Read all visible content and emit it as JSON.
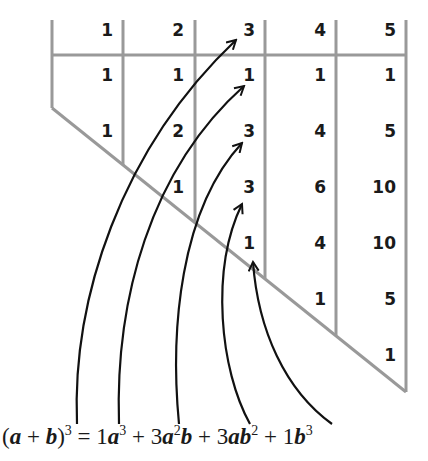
{
  "diagram": {
    "colors": {
      "grid_line": "#999999",
      "text": "#1a1a1a",
      "arrow": "#111111",
      "background": "#ffffff"
    },
    "header": [
      "1",
      "2",
      "3",
      "4",
      "5"
    ],
    "columns": [
      {
        "n": "1",
        "values": [
          "1",
          "1",
          "1"
        ]
      },
      {
        "n": "2",
        "values": [
          "1",
          "2",
          "1"
        ]
      },
      {
        "n": "3",
        "values": [
          "1",
          "3",
          "3",
          "1"
        ]
      },
      {
        "n": "4",
        "values": [
          "1",
          "4",
          "6",
          "4",
          "1"
        ]
      },
      {
        "n": "5",
        "values": [
          "1",
          "5",
          "10",
          "10",
          "5",
          "1"
        ]
      }
    ],
    "cells": [
      {
        "col": 0,
        "row": 0,
        "text": "1"
      },
      {
        "col": 0,
        "row": 1,
        "text": "1"
      },
      {
        "col": 1,
        "row": 0,
        "text": "1"
      },
      {
        "col": 1,
        "row": 1,
        "text": "2"
      },
      {
        "col": 1,
        "row": 2,
        "text": "1"
      },
      {
        "col": 2,
        "row": 0,
        "text": "1"
      },
      {
        "col": 2,
        "row": 1,
        "text": "3"
      },
      {
        "col": 2,
        "row": 2,
        "text": "3"
      },
      {
        "col": 2,
        "row": 3,
        "text": "1"
      },
      {
        "col": 3,
        "row": 0,
        "text": "1"
      },
      {
        "col": 3,
        "row": 1,
        "text": "4"
      },
      {
        "col": 3,
        "row": 2,
        "text": "6"
      },
      {
        "col": 3,
        "row": 3,
        "text": "4"
      },
      {
        "col": 3,
        "row": 4,
        "text": "1"
      },
      {
        "col": 4,
        "row": 0,
        "text": "1"
      },
      {
        "col": 4,
        "row": 1,
        "text": "5"
      },
      {
        "col": 4,
        "row": 2,
        "text": "10"
      },
      {
        "col": 4,
        "row": 3,
        "text": "10"
      },
      {
        "col": 4,
        "row": 4,
        "text": "5"
      },
      {
        "col": 4,
        "row": 5,
        "text": "1"
      }
    ],
    "formula": {
      "lhs_open": "(",
      "a": "a",
      "plus": "+",
      "b": "b",
      "lhs_close": ")",
      "lhs_exp": "3",
      "equals": "=",
      "terms": [
        {
          "coef": "1",
          "vars": [
            {
              "v": "a",
              "e": "3"
            }
          ]
        },
        {
          "coef": "3",
          "vars": [
            {
              "v": "a",
              "e": "2"
            },
            {
              "v": "b",
              "e": ""
            }
          ]
        },
        {
          "coef": "3",
          "vars": [
            {
              "v": "a",
              "e": ""
            },
            {
              "v": "b",
              "e": "2"
            }
          ]
        },
        {
          "coef": "1",
          "vars": [
            {
              "v": "b",
              "e": "3"
            }
          ]
        }
      ],
      "text": "(a + b)^3 = 1a^3 + 3a^2b + 3ab^2 + 1b^3"
    },
    "arrows": [
      {
        "from_term": "(a+b)^3 exponent",
        "to": "header 3"
      },
      {
        "from_term": "1a^3",
        "to": "column 3 value 1 (row 1)"
      },
      {
        "from_term": "3a^2b",
        "to": "column 3 value 3 (row 2)"
      },
      {
        "from_term": "3ab^2",
        "to": "column 3 value 3 (row 3)"
      },
      {
        "from_term": "1b^3",
        "to": "column 3 value 1 (row 4)"
      }
    ]
  }
}
